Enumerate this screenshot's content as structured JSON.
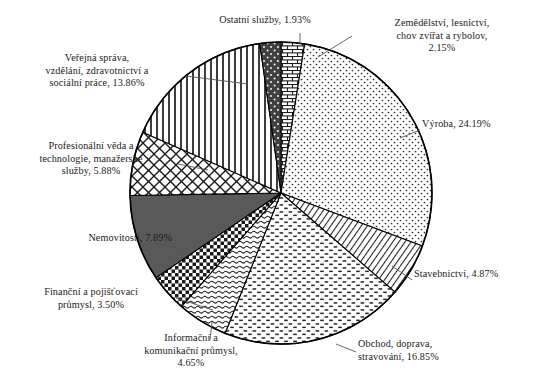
{
  "chart_data": {
    "type": "pie",
    "title": "",
    "subtitle": "",
    "xlabel": "",
    "ylabel": "",
    "grid": false,
    "legend_position": "none",
    "label_format": "name, percent",
    "total_percent": 100.0,
    "start_angle_deg": 0,
    "direction": "clockwise",
    "categories": [
      "Zemědělství, lesnictví, chov zvířat a rybolov",
      "Výroba",
      "Stavebnictví",
      "Obchod, doprava, stravování",
      "Informační a komunikační průmysl",
      "Finanční a pojišťovací průmysl",
      "Nemovitosti",
      "Profesionální věda a technologie, manažerské služby",
      "Veřejná správa, vzdělání, zdravotnictví a sociální práce",
      "Ostatní služby"
    ],
    "values": [
      2.15,
      24.19,
      4.87,
      16.85,
      4.65,
      3.5,
      7.89,
      5.88,
      13.86,
      1.93
    ],
    "slices": [
      {
        "name": "Zemědělství, lesnictví, chov zvířat a rybolov",
        "value": 2.15,
        "pattern": "brick",
        "label": "Zemědělství, lesnictví,\nchov zvířat a rybolov,\n2.15%"
      },
      {
        "name": "Výroba",
        "value": 24.19,
        "pattern": "fine-dots",
        "label": "Výroba, 24.19%"
      },
      {
        "name": "Stavebnictví",
        "value": 4.87,
        "pattern": "diagonal-hatch",
        "label": "Stavebnictví, 4.87%"
      },
      {
        "name": "Obchod, doprava, stravování",
        "value": 16.85,
        "pattern": "dashes",
        "label": "Obchod, doprava,\nstravování, 16.85%"
      },
      {
        "name": "Informační a komunikační průmysl",
        "value": 4.65,
        "pattern": "wavy-dashes",
        "label": "Informační a\nkomunikační průmysl,\n4.65%"
      },
      {
        "name": "Finanční a pojišťovací průmysl",
        "value": 3.5,
        "pattern": "checkerboard",
        "label": "Finanční a pojišťovací\nprůmysl, 3.50%"
      },
      {
        "name": "Nemovitosti",
        "value": 7.89,
        "pattern": "solid-gray",
        "label": "Nemovitosti, 7.89%"
      },
      {
        "name": "Profesionální věda a technologie, manažerské služby",
        "value": 5.88,
        "pattern": "cross-hatch",
        "label": "Profesionální věda a\ntechnologie, manažerské\nslužby, 5.88%"
      },
      {
        "name": "Veřejná správa, vzdělání, zdravotnictví a sociální práce",
        "value": 13.86,
        "pattern": "vertical-lines",
        "label": "Veřejná správa,\nvzdělání, zdravotnictví a\nsociální práce, 13.86%"
      },
      {
        "name": "Ostatní služby",
        "value": 1.93,
        "pattern": "dark-speckle",
        "label": "Ostatní služby, 1.93%"
      }
    ],
    "colors": {
      "outline": "#000000",
      "background": "#ffffff",
      "solid_gray": "#595959",
      "dark_speckle": "#404040",
      "leader_line": "#555555"
    }
  }
}
